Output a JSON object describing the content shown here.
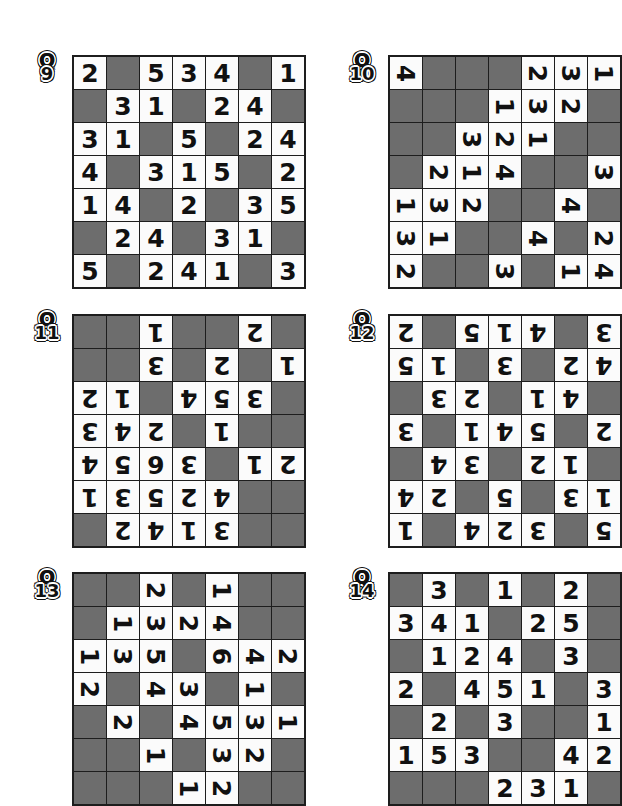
{
  "page": {
    "background": "#ffffff",
    "blank_cell_color": "#6d6d6d",
    "filled_cell_color": "#fbfbfb",
    "digit_color": "#111111",
    "border_color": "#1d1d1d",
    "grid_size": 7,
    "puzzle_count": 6
  },
  "puzzles": [
    {
      "id": "q9",
      "label_letter": "Q",
      "label_number": "9",
      "rotation": 0,
      "left": 72,
      "top": 55,
      "label_left": 30,
      "label_top": 52,
      "cell": 32,
      "rows": [
        [
          "2",
          "",
          "5",
          "3",
          "4",
          "",
          "1"
        ],
        [
          "",
          "3",
          "1",
          "",
          "2",
          "4",
          ""
        ],
        [
          "3",
          "1",
          "",
          "5",
          "",
          "2",
          "4"
        ],
        [
          "4",
          "",
          "3",
          "1",
          "5",
          "",
          "2"
        ],
        [
          "1",
          "4",
          "",
          "2",
          "",
          "3",
          "5"
        ],
        [
          "",
          "2",
          "4",
          "",
          "3",
          "1",
          ""
        ],
        [
          "5",
          "",
          "2",
          "4",
          "1",
          "",
          "3"
        ]
      ]
    },
    {
      "id": "q10",
      "label_letter": "Q",
      "label_number": "10",
      "rotation": 90,
      "left": 388,
      "top": 55,
      "label_left": 345,
      "label_top": 52,
      "cell": 32,
      "rows": [
        [
          "4",
          "",
          "",
          "",
          "2",
          "3",
          "1"
        ],
        [
          "",
          "",
          "",
          "1",
          "3",
          "2",
          ""
        ],
        [
          "",
          "",
          "3",
          "2",
          "1",
          "",
          ""
        ],
        [
          "",
          "2",
          "1",
          "4",
          "",
          "",
          "3"
        ],
        [
          "1",
          "3",
          "2",
          "",
          "",
          "4",
          ""
        ],
        [
          "3",
          "1",
          "",
          "",
          "4",
          "",
          "2"
        ],
        [
          "2",
          "",
          "",
          "3",
          "",
          "1",
          "4"
        ]
      ]
    },
    {
      "id": "q11",
      "label_letter": "Q",
      "label_number": "11",
      "rotation": 180,
      "left": 72,
      "top": 314,
      "label_left": 30,
      "label_top": 311,
      "cell": 32,
      "rows": [
        [
          "",
          "",
          "1",
          "",
          "",
          "2",
          ""
        ],
        [
          "",
          "",
          "3",
          "",
          "2",
          "",
          "1"
        ],
        [
          "2",
          "1",
          "",
          "4",
          "5",
          "3",
          ""
        ],
        [
          "3",
          "4",
          "2",
          "",
          "1",
          "",
          ""
        ],
        [
          "4",
          "5",
          "6",
          "3",
          "",
          "1",
          "2"
        ],
        [
          "1",
          "3",
          "5",
          "2",
          "4",
          "",
          ""
        ],
        [
          "",
          "2",
          "4",
          "1",
          "3",
          "",
          ""
        ]
      ]
    },
    {
      "id": "q12",
      "label_letter": "Q",
      "label_number": "12",
      "rotation": 180,
      "left": 388,
      "top": 314,
      "label_left": 345,
      "label_top": 311,
      "cell": 32,
      "rows": [
        [
          "2",
          "",
          "5",
          "1",
          "4",
          "",
          "3"
        ],
        [
          "5",
          "1",
          "",
          "3",
          "",
          "2",
          "4"
        ],
        [
          "",
          "3",
          "2",
          "",
          "1",
          "4",
          ""
        ],
        [
          "3",
          "",
          "1",
          "4",
          "5",
          "",
          "2"
        ],
        [
          "",
          "4",
          "3",
          "",
          "2",
          "1",
          ""
        ],
        [
          "4",
          "2",
          "",
          "5",
          "",
          "3",
          "1"
        ],
        [
          "1",
          "",
          "4",
          "2",
          "3",
          "",
          "5"
        ]
      ]
    },
    {
      "id": "q13",
      "label_letter": "Q",
      "label_number": "13",
      "rotation": 90,
      "left": 72,
      "top": 572,
      "label_left": 30,
      "label_top": 569,
      "cell": 32,
      "rows": [
        [
          "",
          "",
          "2",
          "",
          "1",
          "",
          ""
        ],
        [
          "",
          "1",
          "3",
          "2",
          "4",
          "",
          ""
        ],
        [
          "1",
          "3",
          "5",
          "",
          "6",
          "4",
          "2"
        ],
        [
          "2",
          "",
          "4",
          "3",
          "",
          "1",
          ""
        ],
        [
          "",
          "2",
          "",
          "4",
          "5",
          "3",
          "1"
        ],
        [
          "",
          "",
          "1",
          "",
          "3",
          "2",
          ""
        ],
        [
          "",
          "",
          "",
          "1",
          "2",
          "",
          ""
        ]
      ]
    },
    {
      "id": "q14",
      "label_letter": "Q",
      "label_number": "14",
      "rotation": 0,
      "left": 388,
      "top": 572,
      "label_left": 345,
      "label_top": 569,
      "cell": 32,
      "rows": [
        [
          "",
          "3",
          "",
          "1",
          "",
          "2",
          ""
        ],
        [
          "3",
          "4",
          "1",
          "",
          "2",
          "5",
          ""
        ],
        [
          "",
          "1",
          "2",
          "4",
          "",
          "3",
          ""
        ],
        [
          "2",
          "",
          "4",
          "5",
          "1",
          "",
          "3"
        ],
        [
          "",
          "2",
          "",
          "3",
          "",
          "",
          "1"
        ],
        [
          "1",
          "5",
          "3",
          "",
          "",
          "4",
          "2"
        ],
        [
          "",
          "",
          "",
          "2",
          "3",
          "1",
          ""
        ]
      ]
    }
  ]
}
